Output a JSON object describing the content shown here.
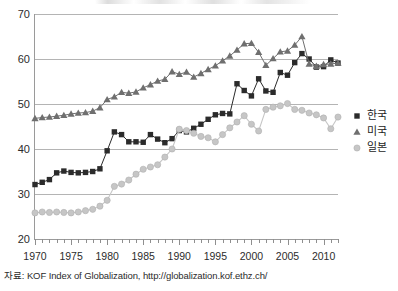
{
  "caption": "자료: KOF Index of Globalization, http://globalization.kof.ethz.ch/",
  "legend": {
    "items": [
      {
        "label": "한국",
        "marker": "square-marker",
        "color": "#2b2b2b"
      },
      {
        "label": "미국",
        "marker": "triangle-marker",
        "color": "#6f6f6f"
      },
      {
        "label": "일본",
        "marker": "circle-marker",
        "color": "#c6c6c6"
      }
    ]
  },
  "chart_data": {
    "type": "line",
    "title": "",
    "xlabel": "",
    "ylabel": "",
    "xlim": [
      1970,
      2012
    ],
    "ylim": [
      20,
      70
    ],
    "yticks": [
      20,
      30,
      40,
      50,
      60,
      70
    ],
    "xticks": [
      1970,
      1975,
      1980,
      1985,
      1990,
      1995,
      2000,
      2005,
      2010
    ],
    "xtick_labels": [
      "1970",
      "1975",
      "1980",
      "1985",
      "1990",
      "1995",
      "2000",
      "2005",
      "2010"
    ],
    "ytick_labels": [
      "20",
      "30",
      "40",
      "50",
      "60",
      "70"
    ],
    "grid": "horizontal",
    "legend_position": "right",
    "x": [
      1970,
      1971,
      1972,
      1973,
      1974,
      1975,
      1976,
      1977,
      1978,
      1979,
      1980,
      1981,
      1982,
      1983,
      1984,
      1985,
      1986,
      1987,
      1988,
      1989,
      1990,
      1991,
      1992,
      1993,
      1994,
      1995,
      1996,
      1997,
      1998,
      1999,
      2000,
      2001,
      2002,
      2003,
      2004,
      2005,
      2006,
      2007,
      2008,
      2009,
      2010,
      2011,
      2012
    ],
    "series": [
      {
        "name": "한국",
        "color": "#2b2b2b",
        "marker": "square",
        "values": [
          32.1,
          32.6,
          33.2,
          34.7,
          35.1,
          34.8,
          34.7,
          34.8,
          35.0,
          35.6,
          39.6,
          43.8,
          43.2,
          41.6,
          41.6,
          41.5,
          43.2,
          42.2,
          41.4,
          42.3,
          44.1,
          43.8,
          44.6,
          45.5,
          46.6,
          47.6,
          47.9,
          47.8,
          54.5,
          53.0,
          51.8,
          55.6,
          52.9,
          52.6,
          57.0,
          56.4,
          59.2,
          61.2,
          60.0,
          58.2,
          58.3,
          59.8,
          59.1
        ]
      },
      {
        "name": "미국",
        "color": "#6f6f6f",
        "marker": "triangle",
        "values": [
          46.8,
          47.0,
          47.1,
          47.3,
          47.5,
          47.8,
          48.0,
          48.1,
          48.4,
          49.2,
          51.0,
          51.6,
          52.6,
          52.4,
          52.7,
          53.6,
          54.3,
          55.1,
          55.5,
          57.2,
          56.6,
          57.1,
          56.0,
          56.8,
          57.7,
          58.5,
          59.6,
          60.7,
          62.0,
          63.4,
          63.5,
          61.5,
          58.6,
          60.1,
          61.6,
          61.8,
          63.1,
          65.0,
          58.9,
          58.4,
          58.8,
          58.9,
          59.1
        ]
      },
      {
        "name": "일본",
        "color": "#c6c6c6",
        "marker": "circle",
        "values": [
          25.8,
          26.0,
          25.9,
          26.0,
          25.9,
          25.8,
          26.0,
          26.3,
          26.6,
          27.3,
          28.6,
          31.7,
          32.2,
          33.1,
          34.4,
          35.5,
          36.0,
          36.5,
          38.2,
          40.0,
          44.4,
          44.1,
          43.5,
          42.8,
          42.5,
          41.6,
          43.2,
          44.7,
          46.0,
          47.4,
          45.5,
          44.0,
          48.8,
          49.3,
          49.6,
          50.1,
          48.8,
          48.6,
          48.0,
          47.6,
          46.9,
          44.5,
          47.1
        ]
      }
    ]
  }
}
